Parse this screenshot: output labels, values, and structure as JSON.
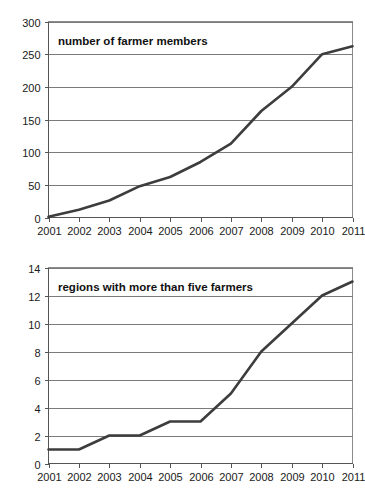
{
  "document": {
    "kind": "two-panel-line-chart-figure",
    "background_color": "#ffffff",
    "line_color": "#3d3d3d",
    "grid_color": "#7a7a7a",
    "axis_color": "#555555"
  },
  "chart_data": [
    {
      "id": "farmer-members",
      "type": "line",
      "title": "number of farmer members",
      "xlabel": "",
      "ylabel": "",
      "grid": true,
      "legend": "none",
      "x": [
        2001,
        2002,
        2003,
        2004,
        2005,
        2006,
        2007,
        2008,
        2009,
        2010,
        2011
      ],
      "categories": [
        "2001",
        "2002",
        "2003",
        "2004",
        "2005",
        "2006",
        "2007",
        "2008",
        "2009",
        "2010",
        "2011"
      ],
      "values": [
        1,
        12,
        26,
        48,
        62,
        85,
        113,
        163,
        200,
        250,
        262
      ],
      "ylim": [
        0,
        300
      ],
      "yticks": [
        0,
        50,
        100,
        150,
        200,
        250,
        300
      ],
      "xlim": [
        2001,
        2011
      ]
    },
    {
      "id": "regions-five-farmers",
      "type": "line",
      "title": "regions with more than five farmers",
      "xlabel": "",
      "ylabel": "",
      "grid": true,
      "legend": "none",
      "x": [
        2001,
        2002,
        2003,
        2004,
        2005,
        2006,
        2007,
        2008,
        2009,
        2010,
        2011
      ],
      "categories": [
        "2001",
        "2002",
        "2003",
        "2004",
        "2005",
        "2006",
        "2007",
        "2008",
        "2009",
        "2010",
        "2011"
      ],
      "values": [
        1,
        1,
        2,
        2,
        3,
        3,
        5,
        8,
        10,
        12,
        13
      ],
      "ylim": [
        0,
        14
      ],
      "yticks": [
        0,
        2,
        4,
        6,
        8,
        10,
        12,
        14
      ],
      "xlim": [
        2001,
        2011
      ]
    }
  ]
}
